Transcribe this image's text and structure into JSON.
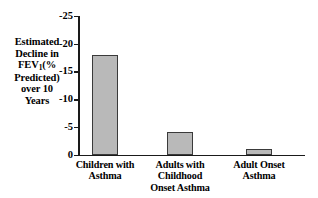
{
  "chart_data": {
    "type": "bar",
    "title": "",
    "xlabel": "",
    "ylabel": "Estimated Decline in FEV1(% Predicted) over 10 Years",
    "categories": [
      "Children with Asthma",
      "Adults with Childhood Onset Asthma",
      "Adult Onset Asthma"
    ],
    "values": [
      -18,
      -4,
      -1
    ],
    "ylim": [
      -25,
      0
    ],
    "yticks": [
      -25,
      -20,
      -15,
      -10,
      -5,
      0
    ],
    "ytick_labels": [
      "-25",
      "-20",
      "-15",
      "-10",
      "-5",
      "0"
    ],
    "grid": false,
    "legend": "none",
    "bar_color": "#b9b9b9",
    "bar_edge_color": "#3a3a3a",
    "axis_color": "#1a1a1a",
    "background": "#ffffff"
  },
  "y_axis_title": {
    "line1": "Estimated",
    "line2": "Decline in",
    "line3_pre": "FEV",
    "line3_sub": "1",
    "line3_post": "(%",
    "line4": "Predicted)",
    "line5": "over 10",
    "line6": "Years"
  },
  "category_labels": [
    {
      "line1": "Children with",
      "line2": "Asthma",
      "line3": ""
    },
    {
      "line1": "Adults with",
      "line2": "Childhood",
      "line3": "Onset Asthma"
    },
    {
      "line1": "Adult Onset",
      "line2": "Asthma",
      "line3": ""
    }
  ],
  "ticks": [
    {
      "label": "-25"
    },
    {
      "label": "-20"
    },
    {
      "label": "-15"
    },
    {
      "label": "-10"
    },
    {
      "label": "-5"
    },
    {
      "label": "0"
    }
  ]
}
